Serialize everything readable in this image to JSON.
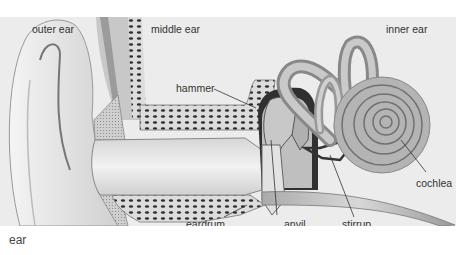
{
  "caption": "ear",
  "diagram": {
    "title": "ear",
    "regions": {
      "outer_ear": "outer ear",
      "middle_ear": "middle ear",
      "inner_ear": "inner ear"
    },
    "parts": {
      "hammer": "hammer",
      "anvil": "anvil",
      "stirrup": "stirrup",
      "eardrum": "eardrum",
      "cochlea": "cochlea"
    },
    "colors": {
      "background": "#ececec",
      "tissue": "#d4d4d4",
      "bone_dark": "#3a3a3a",
      "label": "#333333"
    }
  }
}
